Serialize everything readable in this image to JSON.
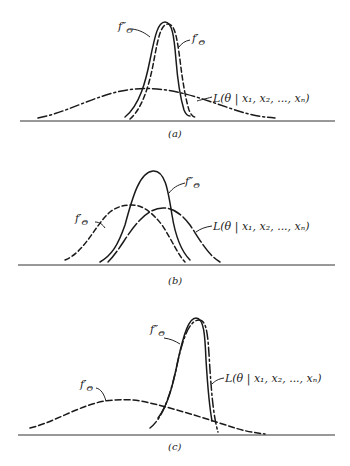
{
  "figure": {
    "panels": [
      {
        "id": "a",
        "caption": "(a)",
        "labels": {
          "posterior": "f″",
          "posterior_sub": "Θ",
          "prior": "f′",
          "prior_sub": "Θ",
          "likelihood": "L(θ | x₁, x₂, ..., xₙ)"
        },
        "description": "Sharp prior, flat likelihood: posterior nearly coincides with prior"
      },
      {
        "id": "b",
        "caption": "(b)",
        "labels": {
          "posterior": "f″",
          "posterior_sub": "Θ",
          "prior": "f′",
          "prior_sub": "Θ",
          "likelihood": "L(θ | x₁, x₂, ..., xₙ)"
        },
        "description": "Prior and likelihood comparable: posterior lies between and is sharper"
      },
      {
        "id": "c",
        "caption": "(c)",
        "labels": {
          "posterior": "f″",
          "posterior_sub": "Θ",
          "prior": "f′",
          "prior_sub": "Θ",
          "likelihood": "L(θ | x₁, x₂, ..., xₙ)"
        },
        "description": "Flat prior, sharp likelihood: posterior nearly coincides with likelihood"
      }
    ],
    "legend_styles": {
      "posterior": "solid",
      "prior": "dashed",
      "likelihood": "dash-dot"
    }
  }
}
